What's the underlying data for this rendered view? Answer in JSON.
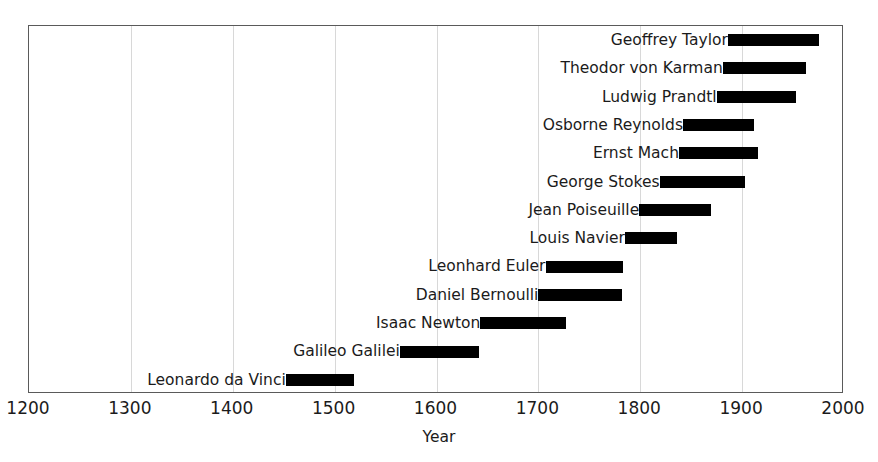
{
  "chart_data": {
    "type": "bar",
    "orientation": "horizontal",
    "subtype": "timeline-lifespan",
    "title": "",
    "xlabel": "Year",
    "ylabel": "",
    "xlim": [
      1200,
      2000
    ],
    "xticks": [
      1200,
      1300,
      1400,
      1500,
      1600,
      1700,
      1800,
      1900,
      2000
    ],
    "xtick_labels": [
      "1200",
      "1300",
      "1400",
      "1500",
      "1600",
      "1700",
      "1800",
      "1900",
      "2000"
    ],
    "grid": "vertical",
    "legend": "none",
    "bar_color": "#000000",
    "categories": [
      "Geoffrey Taylor",
      "Theodor von Karman",
      "Ludwig Prandtl",
      "Osborne Reynolds",
      "Ernst Mach",
      "George Stokes",
      "Jean Poiseuille",
      "Louis Navier",
      "Leonhard Euler",
      "Daniel Bernoulli",
      "Isaac Newton",
      "Galileo Galilei",
      "Leonardo da Vinci"
    ],
    "bars": [
      {
        "label": "Geoffrey Taylor",
        "start": 1886,
        "end": 1975
      },
      {
        "label": "Theodor von Karman",
        "start": 1881,
        "end": 1963
      },
      {
        "label": "Ludwig Prandtl",
        "start": 1875,
        "end": 1953
      },
      {
        "label": "Osborne Reynolds",
        "start": 1842,
        "end": 1912
      },
      {
        "label": "Ernst Mach",
        "start": 1838,
        "end": 1916
      },
      {
        "label": "George Stokes",
        "start": 1819,
        "end": 1903
      },
      {
        "label": "Jean Poiseuille",
        "start": 1799,
        "end": 1869
      },
      {
        "label": "Louis Navier",
        "start": 1785,
        "end": 1836
      },
      {
        "label": "Leonhard Euler",
        "start": 1707,
        "end": 1783
      },
      {
        "label": "Daniel Bernoulli",
        "start": 1700,
        "end": 1782
      },
      {
        "label": "Isaac Newton",
        "start": 1643,
        "end": 1727
      },
      {
        "label": "Galileo Galilei",
        "start": 1564,
        "end": 1642
      },
      {
        "label": "Leonardo da Vinci",
        "start": 1452,
        "end": 1519
      }
    ]
  }
}
